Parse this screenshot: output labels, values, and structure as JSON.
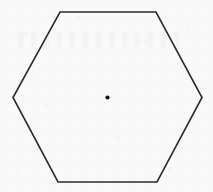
{
  "figure": {
    "title": "Regular hexagon with center point",
    "canvas": {
      "width": 213,
      "height": 192
    },
    "background": {
      "name": "scanned-paper",
      "color": "#fafafa",
      "texture": "light scan noise with faint jpeg blocking and bleed-through ghosting"
    },
    "shapes": [
      {
        "name": "hexagon",
        "type": "polygon",
        "sides": 6,
        "regular": true,
        "filled": false,
        "stroke_color": "#2b2b2b",
        "stroke_width": 1.6,
        "points": [
          {
            "x": 60.0,
            "y": 12.0
          },
          {
            "x": 156.0,
            "y": 12.0
          },
          {
            "x": 202.0,
            "y": 97.5
          },
          {
            "x": 157.0,
            "y": 182.0
          },
          {
            "x": 58.0,
            "y": 182.0
          },
          {
            "x": 13.0,
            "y": 97.5
          }
        ],
        "points_path": "60,12 156,12 202,97.5 157,182 58,182 13,97.5"
      },
      {
        "name": "center-point",
        "type": "dot",
        "filled": true,
        "fill_color": "#141414",
        "center": {
          "x": 107.5,
          "y": 97.5
        },
        "radius": 2.1
      }
    ]
  }
}
